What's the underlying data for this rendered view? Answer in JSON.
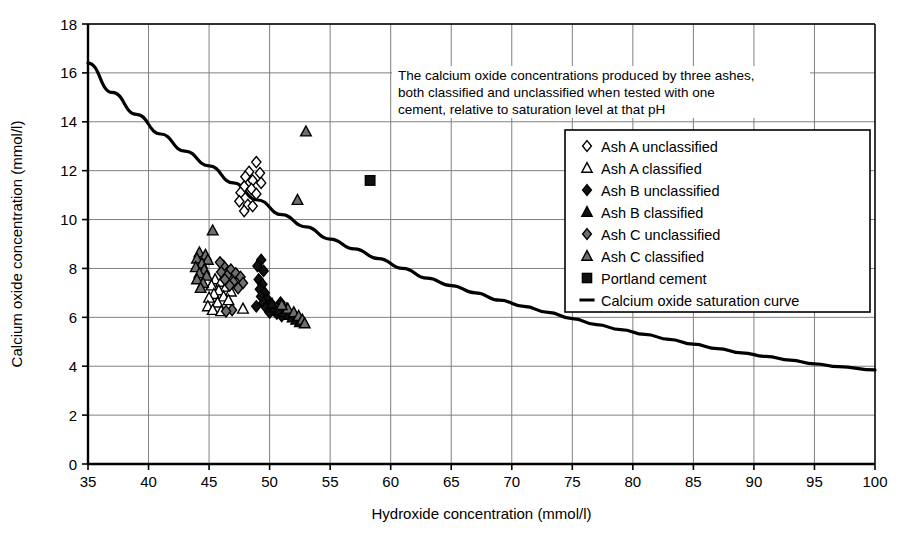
{
  "chart_data": {
    "type": "scatter",
    "title": "",
    "xlabel": "Hydroxide concentration (mmol/l)",
    "ylabel": "Calcium oxide concentration (mmol/l)",
    "xlim": [
      35,
      100
    ],
    "ylim": [
      0,
      18
    ],
    "xticks": [
      35,
      40,
      45,
      50,
      55,
      60,
      65,
      70,
      75,
      80,
      85,
      90,
      95,
      100
    ],
    "yticks": [
      0,
      2,
      4,
      6,
      8,
      10,
      12,
      14,
      16,
      18
    ],
    "grid": true,
    "legend_position": "upper right",
    "annotation": "The calcium oxide concentrations produced by three ashes, both classified and unclassified when tested with one cement, relative to saturation level at that pH",
    "series": [
      {
        "name": "Ash A unclassified",
        "marker": "diamond-open",
        "fill": "#ffffff",
        "stroke": "#000000",
        "points": [
          [
            48.9,
            12.35
          ],
          [
            48.3,
            11.95
          ],
          [
            49.2,
            11.9
          ],
          [
            48.0,
            11.75
          ],
          [
            48.6,
            11.6
          ],
          [
            49.3,
            11.5
          ],
          [
            47.9,
            11.35
          ],
          [
            48.5,
            11.25
          ],
          [
            47.6,
            11.1
          ],
          [
            48.9,
            11.05
          ],
          [
            47.5,
            10.75
          ],
          [
            48.2,
            10.6
          ],
          [
            48.6,
            10.55
          ],
          [
            47.9,
            10.35
          ]
        ]
      },
      {
        "name": "Ash A classified",
        "marker": "triangle-open",
        "fill": "#ffffff",
        "stroke": "#000000",
        "points": [
          [
            45.5,
            7.55
          ],
          [
            46.0,
            7.45
          ],
          [
            45.2,
            7.3
          ],
          [
            46.4,
            7.25
          ],
          [
            45.8,
            7.1
          ],
          [
            46.8,
            7.05
          ],
          [
            45.4,
            6.95
          ],
          [
            46.2,
            6.85
          ],
          [
            45.0,
            6.8
          ],
          [
            46.6,
            6.7
          ],
          [
            45.7,
            6.6
          ],
          [
            44.9,
            6.45
          ],
          [
            45.3,
            6.3
          ],
          [
            46.0,
            6.25
          ],
          [
            47.8,
            6.35
          ]
        ]
      },
      {
        "name": "Ash B unclassified",
        "marker": "diamond-filled",
        "fill": "#111111",
        "stroke": "#000000",
        "points": [
          [
            49.3,
            8.35
          ],
          [
            49.0,
            8.1
          ],
          [
            49.5,
            7.9
          ],
          [
            49.1,
            7.55
          ],
          [
            49.4,
            7.35
          ],
          [
            49.2,
            7.15
          ],
          [
            49.6,
            7.0
          ],
          [
            49.3,
            6.85
          ],
          [
            49.8,
            6.75
          ],
          [
            49.5,
            6.6
          ],
          [
            50.0,
            6.5
          ],
          [
            49.7,
            6.4
          ],
          [
            50.3,
            6.3
          ],
          [
            50.0,
            6.2
          ],
          [
            50.6,
            6.15
          ],
          [
            51.0,
            6.05
          ],
          [
            48.9,
            6.45
          ],
          [
            50.9,
            6.6
          ]
        ]
      },
      {
        "name": "Ash B classified",
        "marker": "triangle-filled",
        "fill": "#111111",
        "stroke": "#000000",
        "points": [
          [
            50.4,
            6.4
          ],
          [
            50.8,
            6.3
          ],
          [
            51.2,
            6.2
          ],
          [
            51.6,
            6.1
          ],
          [
            51.9,
            6.0
          ],
          [
            52.2,
            5.9
          ],
          [
            52.5,
            5.8
          ],
          [
            51.4,
            6.35
          ],
          [
            50.2,
            6.55
          ]
        ]
      },
      {
        "name": "Ash C unclassified",
        "marker": "diamond-gray",
        "fill": "#6f6f6f",
        "stroke": "#000000",
        "points": [
          [
            46.2,
            8.1
          ],
          [
            46.8,
            7.95
          ],
          [
            46.0,
            7.85
          ],
          [
            47.2,
            7.8
          ],
          [
            46.5,
            7.7
          ],
          [
            47.6,
            7.65
          ],
          [
            46.3,
            7.55
          ],
          [
            47.0,
            7.45
          ],
          [
            47.8,
            7.4
          ],
          [
            46.7,
            7.3
          ],
          [
            47.4,
            7.2
          ],
          [
            46.9,
            6.3
          ],
          [
            46.4,
            6.25
          ],
          [
            45.9,
            8.25
          ]
        ]
      },
      {
        "name": "Ash C classified",
        "marker": "triangle-gray",
        "fill": "#6f6f6f",
        "stroke": "#000000",
        "points": [
          [
            53.0,
            13.6
          ],
          [
            52.3,
            10.8
          ],
          [
            45.3,
            9.55
          ],
          [
            44.2,
            8.65
          ],
          [
            44.7,
            8.55
          ],
          [
            44.0,
            8.4
          ],
          [
            44.9,
            8.35
          ],
          [
            44.4,
            8.2
          ],
          [
            43.9,
            8.05
          ],
          [
            44.6,
            7.95
          ],
          [
            44.2,
            7.8
          ],
          [
            44.8,
            7.7
          ],
          [
            44.0,
            7.55
          ],
          [
            44.5,
            7.4
          ],
          [
            44.3,
            7.2
          ],
          [
            51.5,
            6.35
          ],
          [
            52.0,
            6.2
          ],
          [
            52.4,
            6.05
          ],
          [
            52.7,
            5.9
          ],
          [
            52.9,
            5.75
          ],
          [
            51.0,
            6.5
          ]
        ]
      },
      {
        "name": "Portland cement",
        "marker": "square-filled",
        "fill": "#111111",
        "stroke": "#000000",
        "points": [
          [
            58.3,
            11.6
          ]
        ]
      }
    ],
    "curve": {
      "name": "Calcium oxide saturation curve",
      "stroke": "#000000",
      "points": [
        [
          35,
          16.4
        ],
        [
          37,
          15.2
        ],
        [
          39,
          14.3
        ],
        [
          41,
          13.5
        ],
        [
          43,
          12.8
        ],
        [
          45,
          12.2
        ],
        [
          47,
          11.5
        ],
        [
          49,
          10.8
        ],
        [
          51,
          10.2
        ],
        [
          53,
          9.7
        ],
        [
          55,
          9.2
        ],
        [
          57,
          8.8
        ],
        [
          59,
          8.4
        ],
        [
          61,
          8.0
        ],
        [
          63,
          7.6
        ],
        [
          65,
          7.3
        ],
        [
          67,
          7.0
        ],
        [
          69,
          6.7
        ],
        [
          71,
          6.45
        ],
        [
          73,
          6.2
        ],
        [
          75,
          5.95
        ],
        [
          77,
          5.7
        ],
        [
          79,
          5.5
        ],
        [
          81,
          5.3
        ],
        [
          83,
          5.1
        ],
        [
          85,
          4.9
        ],
        [
          87,
          4.72
        ],
        [
          89,
          4.55
        ],
        [
          91,
          4.4
        ],
        [
          93,
          4.25
        ],
        [
          95,
          4.1
        ],
        [
          97,
          3.98
        ],
        [
          100,
          3.85
        ]
      ]
    }
  },
  "legend": {
    "items": [
      {
        "label": "Ash A unclassified",
        "marker": "diamond-open"
      },
      {
        "label": "Ash A classified",
        "marker": "triangle-open"
      },
      {
        "label": "Ash B unclassified",
        "marker": "diamond-filled"
      },
      {
        "label": "Ash B classified",
        "marker": "triangle-filled"
      },
      {
        "label": "Ash C unclassified",
        "marker": "diamond-gray"
      },
      {
        "label": "Ash C classified",
        "marker": "triangle-gray"
      },
      {
        "label": "Portland cement",
        "marker": "square-filled"
      },
      {
        "label": "Calcium oxide saturation curve",
        "marker": "line"
      }
    ]
  },
  "caption": {
    "line1": "The calcium oxide concentrations produced by three ashes,",
    "line2": "both classified and unclassified when tested with one",
    "line3": "cement, relative to saturation level at that pH"
  },
  "colors": {
    "axis": "#000000",
    "grid": "#808080",
    "gray_marker": "#6f6f6f",
    "black_marker": "#111111",
    "background": "#ffffff"
  }
}
